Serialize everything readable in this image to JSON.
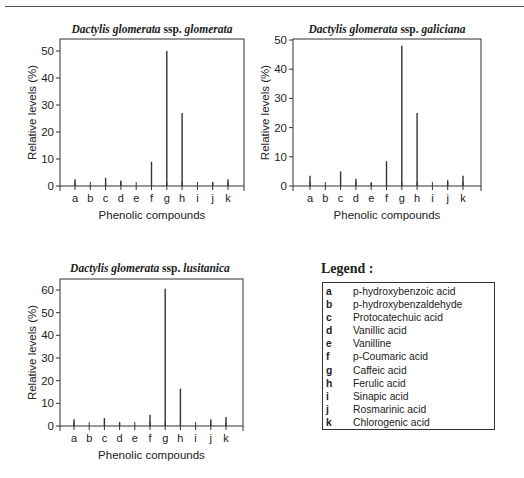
{
  "chart_data": [
    {
      "type": "bar",
      "title": "Dactylis glomerata ssp. glomerata",
      "title_italic": "Dactylis glomerata",
      "title_plain": " ssp. ",
      "title_sub": "glomerata",
      "xlabel": "Phenolic compounds",
      "ylabel": "Relative levels (%)",
      "categories": [
        "a",
        "b",
        "c",
        "d",
        "e",
        "f",
        "g",
        "h",
        "i",
        "j",
        "k"
      ],
      "values": [
        2.5,
        0,
        3,
        2,
        0,
        9,
        50,
        27,
        0,
        1.5,
        2.5
      ],
      "yticks": [
        0,
        10,
        20,
        30,
        40,
        50
      ],
      "ylim": [
        0,
        53
      ],
      "grid": false
    },
    {
      "type": "bar",
      "title": "Dactylis glomerata ssp. galiciana",
      "title_italic": "Dactylis glomerata",
      "title_plain": " ssp. ",
      "title_sub": "galiciana",
      "xlabel": "Phenolic compounds",
      "ylabel": "Relative levels (%)",
      "categories": [
        "a",
        "b",
        "c",
        "d",
        "e",
        "f",
        "g",
        "h",
        "i",
        "j",
        "k"
      ],
      "values": [
        3.5,
        0,
        5,
        2.5,
        1,
        8.5,
        48,
        25,
        0,
        2,
        3.5
      ],
      "yticks": [
        0,
        10,
        20,
        30,
        40,
        50
      ],
      "ylim": [
        0,
        50
      ],
      "grid": false
    },
    {
      "type": "bar",
      "title": "Dactylis glomerata ssp. lusitanica",
      "title_italic": "Dactylis glomerata",
      "title_plain": " ssp. ",
      "title_sub": "lusitanica",
      "xlabel": "Phenolic compounds",
      "ylabel": "Relative levels (%)",
      "categories": [
        "a",
        "b",
        "c",
        "d",
        "e",
        "f",
        "g",
        "h",
        "i",
        "j",
        "k"
      ],
      "values": [
        3,
        0,
        3.5,
        1.5,
        0,
        5,
        60.5,
        16.5,
        0,
        3,
        4
      ],
      "yticks": [
        0,
        10,
        20,
        30,
        40,
        50,
        60
      ],
      "ylim": [
        0,
        65
      ],
      "grid": false
    }
  ],
  "legend": {
    "heading": "Legend :",
    "items": [
      {
        "key": "a",
        "label": "p-hydroxybenzoic acid"
      },
      {
        "key": "b",
        "label": "p-hydroxybenzaldehyde"
      },
      {
        "key": "c",
        "label": "Protocatechuic acid"
      },
      {
        "key": "d",
        "label": "Vanillic acid"
      },
      {
        "key": "e",
        "label": "Vanilline"
      },
      {
        "key": "f",
        "label": "p-Coumaric acid"
      },
      {
        "key": "g",
        "label": "Caffeic acid"
      },
      {
        "key": "h",
        "label": "Ferulic acid"
      },
      {
        "key": "i",
        "label": "Sinapic acid"
      },
      {
        "key": "j",
        "label": "Rosmarinic acid"
      },
      {
        "key": "k",
        "label": "Chlorogenic acid"
      }
    ]
  },
  "colors": {
    "axis": "#333333",
    "bar": "#333333",
    "text": "#222222"
  }
}
